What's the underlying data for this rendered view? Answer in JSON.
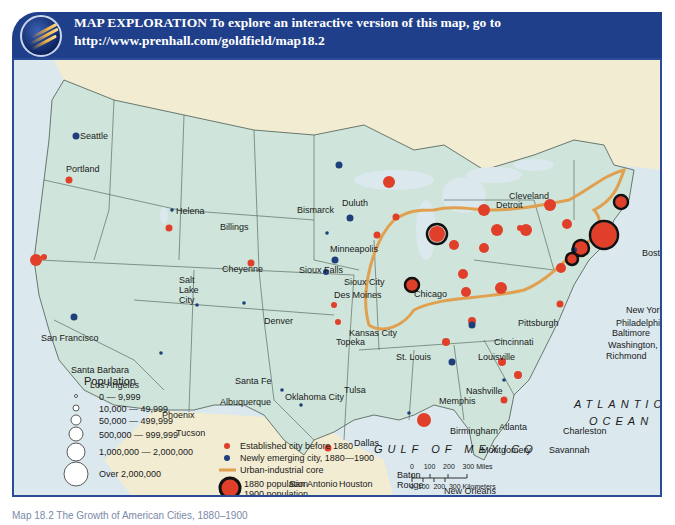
{
  "header": {
    "line1": "MAP EXPLORATION  To explore an interactive version of this map, go to",
    "line2": "http://www.prenhall.com/goldfield/map18.2"
  },
  "caption": "Map 18.2  The Growth of American Cities, 1880–1900",
  "colors": {
    "header_bg": "#1f3f8a",
    "water": "#dbe8ee",
    "land_us": "#cfe4da",
    "land_foreign": "#f2ecd2",
    "established": "#e0402a",
    "emerging": "#1f3f7a",
    "urban_core": "#e0a050"
  },
  "map": {
    "oceans": {
      "atlantic_line1": "ATLANTIC",
      "atlantic_line2": "OCEAN",
      "gulf": "GULF OF MEXICO"
    },
    "cities": [
      {
        "name": "Seattle",
        "type": "emerging"
      },
      {
        "name": "Portland",
        "type": "established"
      },
      {
        "name": "Helena",
        "type": "emerging"
      },
      {
        "name": "Billings",
        "type": "emerging"
      },
      {
        "name": "Bismarck",
        "type": "emerging"
      },
      {
        "name": "Duluth",
        "type": "emerging"
      },
      {
        "name": "Minneapolis",
        "type": "established"
      },
      {
        "name": "Sioux Falls",
        "type": "emerging"
      },
      {
        "name": "Sioux City",
        "type": "emerging"
      },
      {
        "name": "Des Moines",
        "type": "established"
      },
      {
        "name": "Chicago",
        "type": "established"
      },
      {
        "name": "Detroit",
        "type": "established"
      },
      {
        "name": "Cleveland",
        "type": "established"
      },
      {
        "name": "Boston",
        "type": "established"
      },
      {
        "name": "New York",
        "type": "established"
      },
      {
        "name": "Philadelphia",
        "type": "established"
      },
      {
        "name": "Baltimore",
        "type": "established"
      },
      {
        "name": "Washington, D.C.",
        "type": "established"
      },
      {
        "name": "Richmond",
        "type": "established"
      },
      {
        "name": "Pittsburgh",
        "type": "established"
      },
      {
        "name": "Cincinnati",
        "type": "established"
      },
      {
        "name": "Louisville",
        "type": "established"
      },
      {
        "name": "St. Louis",
        "type": "established"
      },
      {
        "name": "Kansas City",
        "type": "established"
      },
      {
        "name": "Topeka",
        "type": "established"
      },
      {
        "name": "Salt Lake City",
        "type": "established"
      },
      {
        "name": "Cheyenne",
        "type": "emerging"
      },
      {
        "name": "Denver",
        "type": "established"
      },
      {
        "name": "San Francisco",
        "type": "established"
      },
      {
        "name": "Santa Barbara",
        "type": "established"
      },
      {
        "name": "Los Angeles",
        "type": "emerging"
      },
      {
        "name": "Santa Fe",
        "type": "established"
      },
      {
        "name": "Albuquerque",
        "type": "established"
      },
      {
        "name": "Phoenix",
        "type": "emerging"
      },
      {
        "name": "Tucson",
        "type": "established"
      },
      {
        "name": "Oklahoma City",
        "type": "emerging"
      },
      {
        "name": "Tulsa",
        "type": "emerging"
      },
      {
        "name": "Dallas",
        "type": "established"
      },
      {
        "name": "San Antonio",
        "type": "established"
      },
      {
        "name": "Houston",
        "type": "established"
      },
      {
        "name": "Baton Rouge",
        "type": "emerging"
      },
      {
        "name": "New Orleans",
        "type": "established"
      },
      {
        "name": "Memphis",
        "type": "established"
      },
      {
        "name": "Nashville",
        "type": "established"
      },
      {
        "name": "Birmingham",
        "type": "emerging"
      },
      {
        "name": "Atlanta",
        "type": "established"
      },
      {
        "name": "Montgomery",
        "type": "established"
      },
      {
        "name": "Charleston",
        "type": "established"
      },
      {
        "name": "Savannah",
        "type": "established"
      },
      {
        "name": "Tampa",
        "type": "emerging"
      }
    ]
  },
  "legend": {
    "population_title": "Population",
    "sizes": [
      "0 — 9,999",
      "10,000 — 49,999",
      "50,000 — 499,999",
      "500,000 — 999,999",
      "1,000,000 — 2,000,000",
      "Over 2,000,000"
    ],
    "established": "Established city before 1880",
    "emerging": "Newly emerging city, 1880—1900",
    "urban_core": "Urban-industrial core",
    "pop_1880": "1880 population",
    "pop_1900": "1900 population"
  },
  "scale": {
    "miles": [
      "0",
      "100",
      "200",
      "300 Miles"
    ],
    "km": [
      "0",
      "100",
      "200",
      "300 Kilometers"
    ]
  }
}
